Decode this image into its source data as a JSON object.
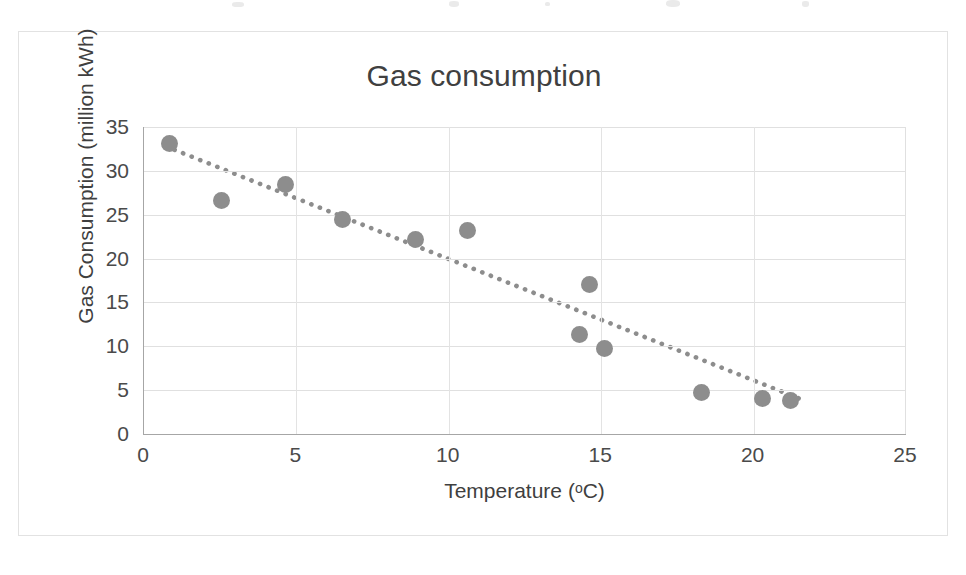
{
  "chart_data": {
    "type": "scatter",
    "title": "Gas consumption",
    "xlabel": "Temperature (oC)",
    "xlabel_prefix": "Temperature (",
    "xlabel_degree": "o",
    "xlabel_suffix": "C)",
    "ylabel": "Gas Consumption (million kWh)",
    "xlim": [
      0,
      25
    ],
    "ylim": [
      0,
      35
    ],
    "xticks": [
      0,
      5,
      10,
      15,
      20,
      25
    ],
    "yticks": [
      0,
      5,
      10,
      15,
      20,
      25,
      30,
      35
    ],
    "grid": "horizontal-and-vertical",
    "legend": "none",
    "marker_color": "#8d8d8d",
    "marker_shape": "circle",
    "gridline_color": "#e0e0e0",
    "axis_color": "#a6a6a6",
    "text_color": "#404040",
    "background_color": "#ffffff",
    "points": [
      {
        "x": 0.85,
        "y": 33.1
      },
      {
        "x": 2.55,
        "y": 26.6
      },
      {
        "x": 4.65,
        "y": 28.4
      },
      {
        "x": 6.5,
        "y": 24.4
      },
      {
        "x": 8.9,
        "y": 22.2
      },
      {
        "x": 10.6,
        "y": 23.2
      },
      {
        "x": 14.3,
        "y": 11.3
      },
      {
        "x": 14.6,
        "y": 17.0
      },
      {
        "x": 15.1,
        "y": 9.8
      },
      {
        "x": 18.3,
        "y": 4.7
      },
      {
        "x": 20.3,
        "y": 4.1
      },
      {
        "x": 21.2,
        "y": 3.8
      }
    ],
    "trendline": {
      "style": "dotted",
      "color": "#8d8d8d",
      "x_start": 1.0,
      "y_start": 32.4,
      "x_end": 21.6,
      "y_end": 3.9
    }
  },
  "scan_artifacts": [
    {
      "left": 232,
      "top": 2,
      "width": 12,
      "height": 5
    },
    {
      "left": 449,
      "top": 1,
      "width": 10,
      "height": 6
    },
    {
      "left": 545,
      "top": 2,
      "width": 5,
      "height": 4
    },
    {
      "left": 666,
      "top": 0,
      "width": 14,
      "height": 7
    },
    {
      "left": 802,
      "top": 1,
      "width": 7,
      "height": 6
    }
  ]
}
